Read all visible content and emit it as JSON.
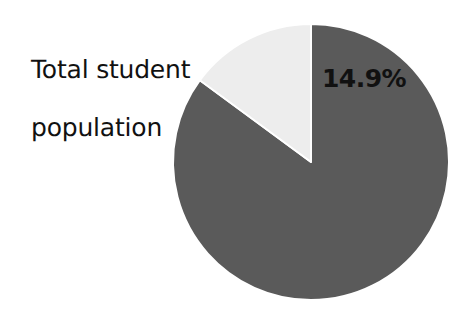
{
  "figure": {
    "background_color": "#ffffff",
    "width": 473,
    "height": 315
  },
  "caption": {
    "line1": "Total student",
    "line2": "population",
    "color": "#111111"
  },
  "chart_data": {
    "type": "pie",
    "title": "Total student population",
    "xlabel": "",
    "ylabel": "",
    "categories": [
      "Remainder",
      "Highlighted group"
    ],
    "values": [
      85.1,
      14.9
    ],
    "labels": [
      "",
      "14.9%"
    ],
    "data_labels_shown": [
      "14.9%"
    ],
    "colors": [
      "#5a5a5a",
      "#ededed"
    ],
    "slice_edge_color": "#ffffff",
    "slice_edge_width": 2,
    "start_angle_deg": 90,
    "direction": "clockwise",
    "legend": "none",
    "grid": false,
    "center_px": [
      311,
      162
    ],
    "radius_px": 138
  }
}
